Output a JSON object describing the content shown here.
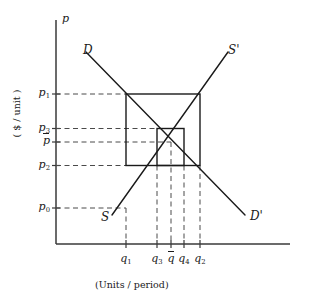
{
  "axes": {
    "y_axis_symbol": "p",
    "y_axis_caption": "( $ / unit )",
    "x_axis_caption": "(Units / period)"
  },
  "curve_labels": {
    "demand_start": "D",
    "demand_end": "D'",
    "supply_start": "S",
    "supply_end": "S'"
  },
  "price_ticks": [
    {
      "key": "p1",
      "label": "p",
      "sub": "1",
      "bar": false,
      "y": 94.0
    },
    {
      "key": "p3",
      "label": "p",
      "sub": "3",
      "bar": false,
      "y": 128.5
    },
    {
      "key": "pbar",
      "label": "p",
      "sub": "",
      "bar": true,
      "y": 142.0
    },
    {
      "key": "p2",
      "label": "p",
      "sub": "2",
      "bar": false,
      "y": 165.5
    },
    {
      "key": "p0",
      "label": "p",
      "sub": "0",
      "bar": false,
      "y": 208.0
    }
  ],
  "quantity_ticks": [
    {
      "key": "q1",
      "label": "q",
      "sub": "1",
      "bar": false,
      "x": 126.0
    },
    {
      "key": "q3",
      "label": "q",
      "sub": "3",
      "bar": false,
      "x": 157.0
    },
    {
      "key": "qbar",
      "label": "q",
      "sub": "",
      "bar": true,
      "x": 171.0
    },
    {
      "key": "q4",
      "label": "q",
      "sub": "4",
      "bar": false,
      "x": 184.0
    },
    {
      "key": "q2",
      "label": "q",
      "sub": "2",
      "bar": false,
      "x": 200.0
    }
  ],
  "chart_data": {
    "type": "line",
    "title": "",
    "xlabel": "(Units / period)",
    "ylabel": "( $ / unit )",
    "grid": false,
    "legend": "inline-curve-labels",
    "xlim": [
      56,
      290
    ],
    "ylim": [
      244,
      20
    ],
    "series": [
      {
        "name": "D",
        "role": "demand-curve",
        "end_label_start": "D",
        "end_label_end": "D'",
        "points": [
          [
            86,
            52
          ],
          [
            245,
            215
          ]
        ]
      },
      {
        "name": "S",
        "role": "supply-curve",
        "end_label_start": "S",
        "end_label_end": "S'",
        "points": [
          [
            112,
            215
          ],
          [
            228,
            52
          ]
        ]
      }
    ],
    "cobweb_outer_rect": {
      "x0": 126,
      "y0": 94,
      "x1": 200,
      "y1": 165.5
    },
    "cobweb_inner_rect": {
      "x0": 157,
      "y0": 128.5,
      "x1": 184,
      "y1": 165.5
    },
    "equilibrium": {
      "q": 171,
      "p": 142
    },
    "price_dashed_from_axis": [
      94.0,
      128.5,
      142.0,
      165.5,
      208.0
    ],
    "quantity_dashed_to_axis": [
      126.0,
      157.0,
      171.0,
      184.0,
      200.0
    ],
    "axis_origin": [
      56,
      244
    ],
    "x_axis_end": 290,
    "y_axis_top": 20
  }
}
